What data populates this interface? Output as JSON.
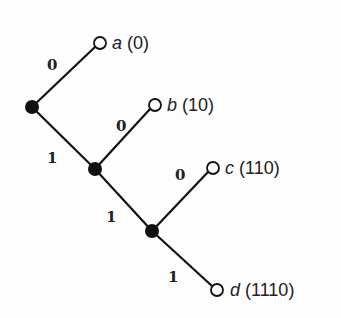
{
  "diagram": {
    "title": "",
    "type": "binary code tree",
    "nodes": [
      {
        "id": "n0",
        "kind": "internal",
        "x": 32,
        "y": 107
      },
      {
        "id": "n1",
        "kind": "internal",
        "x": 95,
        "y": 169
      },
      {
        "id": "n2",
        "kind": "internal",
        "x": 152,
        "y": 231
      },
      {
        "id": "a",
        "kind": "leaf",
        "x": 100,
        "y": 43,
        "symbol": "a",
        "code": "(0)"
      },
      {
        "id": "b",
        "kind": "leaf",
        "x": 155,
        "y": 105,
        "symbol": "b",
        "code": "(10)"
      },
      {
        "id": "c",
        "kind": "leaf",
        "x": 213,
        "y": 168,
        "symbol": "c",
        "code": "(110)"
      },
      {
        "id": "d",
        "kind": "leaf",
        "x": 217,
        "y": 290,
        "symbol": "d",
        "code": "(1110)"
      }
    ],
    "edges": [
      {
        "from": "n0",
        "to": "a",
        "bit": "0"
      },
      {
        "from": "n0",
        "to": "n1",
        "bit": "1"
      },
      {
        "from": "n1",
        "to": "b",
        "bit": "0"
      },
      {
        "from": "n1",
        "to": "n2",
        "bit": "1"
      },
      {
        "from": "n2",
        "to": "c",
        "bit": "0"
      },
      {
        "from": "n2",
        "to": "d",
        "bit": "1"
      }
    ],
    "edge_labels": {
      "e0": "0",
      "e1": "1",
      "e2": "0",
      "e3": "1",
      "e4": "0",
      "e5": "1"
    },
    "leaf_labels": {
      "a": {
        "symbol": "a",
        "code": "(0)"
      },
      "b": {
        "symbol": "b",
        "code": "(10)"
      },
      "c": {
        "symbol": "c",
        "code": "(110)"
      },
      "d": {
        "symbol": "d",
        "code": "(1110)"
      }
    }
  }
}
